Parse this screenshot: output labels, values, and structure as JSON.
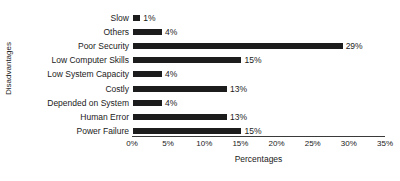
{
  "chart_data": {
    "type": "bar",
    "orientation": "horizontal",
    "title": "",
    "xlabel": "Percentages",
    "ylabel": "Disadvantages",
    "categories": [
      "Slow",
      "Others",
      "Poor Security",
      "Low Computer Skills",
      "Low System Capacity",
      "Costly",
      "Depended on System",
      "Human Error",
      "Power Failure"
    ],
    "values": [
      1,
      4,
      29,
      15,
      4,
      13,
      4,
      13,
      15
    ],
    "value_labels": [
      "1%",
      "4%",
      "29%",
      "15%",
      "4%",
      "13%",
      "4%",
      "13%",
      "15%"
    ],
    "xlim": [
      0,
      35
    ],
    "xticks": [
      0,
      5,
      10,
      15,
      20,
      25,
      30,
      35
    ],
    "xtick_labels": [
      "0%",
      "5%",
      "10%",
      "15%",
      "20%",
      "25%",
      "30%",
      "35%"
    ],
    "grid": false,
    "legend": false,
    "bar_color": "#1c1c1c",
    "background_color": "#ffffff"
  }
}
